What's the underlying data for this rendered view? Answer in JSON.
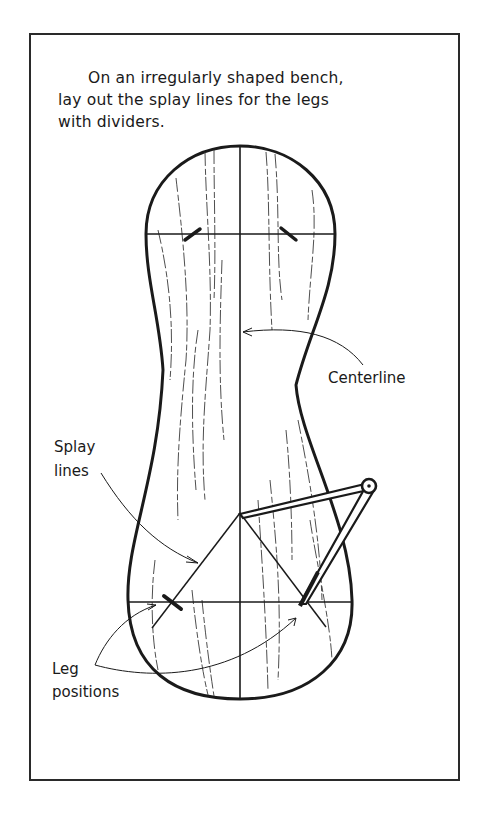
{
  "caption": {
    "line1": "On an irregularly shaped bench,",
    "line2": "lay out the splay lines for the legs",
    "line3": "with dividers."
  },
  "labels": {
    "centerline": "Centerline",
    "splay_line1": "Splay",
    "splay_line2": "lines",
    "leg_line1": "Leg",
    "leg_line2": "positions"
  },
  "colors": {
    "ink": "#1a1a1a",
    "background": "#ffffff",
    "border": "#2a2a2a"
  }
}
